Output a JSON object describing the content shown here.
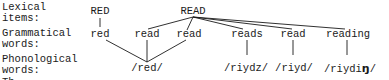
{
  "row_labels": {
    "lexical": [
      "Lexical",
      "items:"
    ],
    "grammatical": [
      "Grammatical",
      "words:"
    ],
    "phonological": [
      "Phonological",
      "words:"
    ],
    "cut": "Th"
  },
  "lexical_items": [
    {
      "id": "RED",
      "label": "RED"
    },
    {
      "id": "READ",
      "label": "READ"
    }
  ],
  "grammatical_words": [
    {
      "id": "g1",
      "label": "red",
      "lexeme": "RED"
    },
    {
      "id": "g2",
      "label": "read",
      "lexeme": "READ"
    },
    {
      "id": "g3",
      "label": "read",
      "lexeme": "READ"
    },
    {
      "id": "g4",
      "label": "reads",
      "lexeme": "READ"
    },
    {
      "id": "g5",
      "label": "read",
      "lexeme": "READ"
    },
    {
      "id": "g6",
      "label": "reading",
      "lexeme": "READ"
    }
  ],
  "phonological_words": [
    {
      "id": "p1",
      "label": "/red/",
      "from": [
        "g1",
        "g2",
        "g3"
      ]
    },
    {
      "id": "p2",
      "label": "/riydz/",
      "from": [
        "g4"
      ]
    },
    {
      "id": "p3",
      "label": "/riyd/",
      "from": [
        "g5"
      ]
    },
    {
      "id": "p4",
      "label_prefix": "/riydi",
      "label_special": "ŋ",
      "label_suffix": "/",
      "from": [
        "g6"
      ]
    }
  ],
  "colors": {
    "ink": "#1a1a1a",
    "background": "#ffffff"
  }
}
